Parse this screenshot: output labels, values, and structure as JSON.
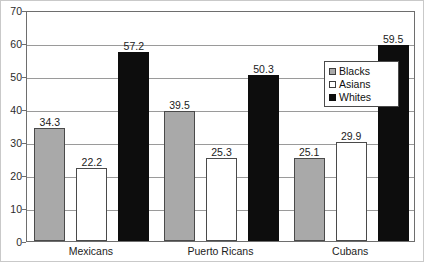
{
  "chart_data": {
    "type": "bar",
    "title": "",
    "xlabel": "",
    "ylabel": "",
    "ylim": [
      0,
      70
    ],
    "ytick_step": 10,
    "yticks": [
      "70",
      "60",
      "50",
      "40",
      "30",
      "20",
      "10",
      "0"
    ],
    "grid": true,
    "legend_position": "inside-upper-right",
    "categories": [
      "Mexicans",
      "Puerto Ricans",
      "Cubans"
    ],
    "series": [
      {
        "name": "Blacks",
        "color": "#a9a9a9",
        "values": [
          34.3,
          39.5,
          25.1
        ]
      },
      {
        "name": "Asians",
        "color": "#ffffff",
        "values": [
          22.2,
          25.3,
          29.9
        ]
      },
      {
        "name": "Whites",
        "color": "#0d0d0d",
        "values": [
          57.2,
          50.3,
          59.5
        ]
      }
    ],
    "data_labels": [
      {
        "text": "34.3",
        "series": "Blacks",
        "category": "Mexicans"
      },
      {
        "text": "22.2",
        "series": "Asians",
        "category": "Mexicans"
      },
      {
        "text": "57.2",
        "series": "Whites",
        "category": "Mexicans"
      },
      {
        "text": "39.5",
        "series": "Blacks",
        "category": "Puerto Ricans"
      },
      {
        "text": "25.3",
        "series": "Asians",
        "category": "Puerto Ricans"
      },
      {
        "text": "50.3",
        "series": "Whites",
        "category": "Puerto Ricans"
      },
      {
        "text": "25.1",
        "series": "Blacks",
        "category": "Cubans"
      },
      {
        "text": "29.9",
        "series": "Asians",
        "category": "Cubans"
      },
      {
        "text": "59.5",
        "series": "Whites",
        "category": "Cubans"
      }
    ]
  },
  "legend": {
    "items": [
      {
        "label": "Blacks",
        "swatch": "gray"
      },
      {
        "label": "Asians",
        "swatch": "white"
      },
      {
        "label": "Whites",
        "swatch": "black"
      }
    ]
  },
  "axis": {
    "y_tick_labels": [
      "70",
      "60",
      "50",
      "40",
      "30",
      "20",
      "10",
      "0"
    ]
  }
}
